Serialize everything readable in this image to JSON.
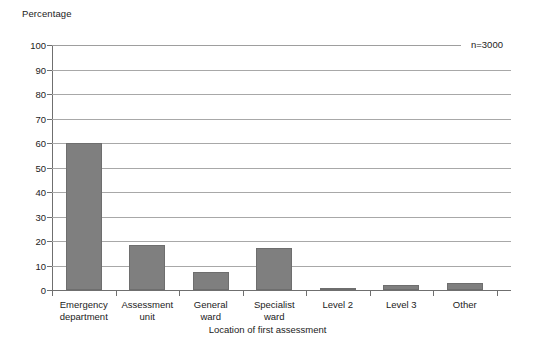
{
  "chart_data": {
    "type": "bar",
    "title": "",
    "subtitle": "",
    "xlabel": "Location of first assessment",
    "ylabel": "Percentage",
    "categories": [
      "Emergency department",
      "Assessment unit",
      "General ward",
      "Specialist ward",
      "Level 2",
      "Level 3",
      "Other"
    ],
    "category_lines": [
      [
        "Emergency",
        "department"
      ],
      [
        "Assessment",
        "unit"
      ],
      [
        "General",
        "ward"
      ],
      [
        "Specialist",
        "ward"
      ],
      [
        "Level 2"
      ],
      [
        "Level 3"
      ],
      [
        "Other"
      ]
    ],
    "values": [
      60,
      18.5,
      7.5,
      17,
      1,
      2,
      3
    ],
    "ylim": [
      0,
      100
    ],
    "ytick_labels": [
      "0",
      "10",
      "20",
      "30",
      "40",
      "50",
      "60",
      "70",
      "80",
      "90",
      "100"
    ],
    "ytick_values": [
      0,
      10,
      20,
      30,
      40,
      50,
      60,
      70,
      80,
      90,
      100
    ],
    "grid": "horizontal",
    "legend": "none",
    "annotations": [
      {
        "name": "sample-size",
        "text": "n=3000"
      }
    ],
    "colors": {
      "bar_fill": "#7f7f7f",
      "bar_stroke": "#6e6e6e",
      "gridline": "#a8a8a8",
      "axis": "#6f6f6f",
      "text": "#222222",
      "background": "#ffffff"
    }
  }
}
